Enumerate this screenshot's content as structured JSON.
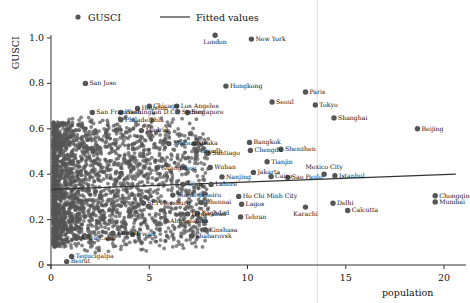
{
  "chart_data": {
    "type": "scatter",
    "title": "",
    "xlabel": "population",
    "ylabel": "GUSCI",
    "xlim": [
      -0.55,
      21.0
    ],
    "ylim": [
      -0.045,
      1.075
    ],
    "xticks": [
      0,
      5,
      10,
      15,
      20
    ],
    "xtick_labels": [
      "0",
      "5",
      "10",
      "15",
      "20"
    ],
    "yticks": [
      0,
      0.2,
      0.4,
      0.6,
      0.8,
      1.0
    ],
    "ytick_labels": [
      "0",
      "0.2",
      "0.4",
      "0.6",
      "0.8",
      "1.0"
    ],
    "grid": false,
    "legend": {
      "position": "top-center",
      "entries": [
        {
          "label": "GUSCI",
          "marker": "circle",
          "color": "#555555"
        },
        {
          "label": "Fitted values",
          "marker": "line",
          "color": "#333333"
        }
      ]
    },
    "marker_color": "#555555",
    "fit_line_color": "#333333",
    "reference_line": {
      "x": 13.55,
      "color": "#d9d9d9",
      "orientation": "vertical"
    },
    "fitted_values": {
      "x": [
        0.05,
        20.6
      ],
      "y": [
        0.333,
        0.4
      ]
    },
    "labeled_points": [
      {
        "name": "London",
        "x": 8.35,
        "y": 1.012,
        "pos": "below-center"
      },
      {
        "name": "New York",
        "x": 10.2,
        "y": 0.995,
        "pos": "right"
      },
      {
        "name": "San Jose",
        "x": 1.75,
        "y": 0.8,
        "pos": "right"
      },
      {
        "name": "Hongkong",
        "x": 8.9,
        "y": 0.788,
        "pos": "right"
      },
      {
        "name": "Paris",
        "x": 12.95,
        "y": 0.762,
        "pos": "right"
      },
      {
        "name": "Seoul",
        "x": 11.25,
        "y": 0.718,
        "pos": "right"
      },
      {
        "name": "Tokyo",
        "x": 13.45,
        "y": 0.705,
        "pos": "right"
      },
      {
        "name": "Shanghai",
        "x": 14.4,
        "y": 0.648,
        "pos": "right"
      },
      {
        "name": "Beijing",
        "x": 18.65,
        "y": 0.6,
        "pos": "right"
      },
      {
        "name": "Chicago",
        "x": 5.0,
        "y": 0.7,
        "pos": "right"
      },
      {
        "name": "Los Angeles",
        "x": 6.4,
        "y": 0.7,
        "pos": "right"
      },
      {
        "name": "Houston",
        "x": 4.4,
        "y": 0.69,
        "pos": "right"
      },
      {
        "name": "Sydney",
        "x": 6.45,
        "y": 0.675,
        "pos": "right"
      },
      {
        "name": "Singapore",
        "x": 6.95,
        "y": 0.672,
        "pos": "right"
      },
      {
        "name": "San Francisco",
        "x": 2.1,
        "y": 0.672,
        "pos": "right"
      },
      {
        "name": "Washington D.C.",
        "x": 3.55,
        "y": 0.672,
        "pos": "right"
      },
      {
        "name": "Philadelphia",
        "x": 3.55,
        "y": 0.64,
        "pos": "right"
      },
      {
        "name": "Madrid",
        "x": 4.6,
        "y": 0.592,
        "pos": "right"
      },
      {
        "name": "Bangkok",
        "x": 10.1,
        "y": 0.54,
        "pos": "right"
      },
      {
        "name": "Melbourne",
        "x": 6.0,
        "y": 0.535,
        "pos": "right"
      },
      {
        "name": "Osaka",
        "x": 7.3,
        "y": 0.535,
        "pos": "right"
      },
      {
        "name": "Shenzhen",
        "x": 11.7,
        "y": 0.51,
        "pos": "right"
      },
      {
        "name": "Chengdu",
        "x": 10.15,
        "y": 0.505,
        "pos": "right"
      },
      {
        "name": "Riyadh",
        "x": 7.4,
        "y": 0.5,
        "pos": "right"
      },
      {
        "name": "Santiago",
        "x": 8.0,
        "y": 0.492,
        "pos": "right"
      },
      {
        "name": "Tianjin",
        "x": 11.0,
        "y": 0.455,
        "pos": "right"
      },
      {
        "name": "Wuhan",
        "x": 8.1,
        "y": 0.43,
        "pos": "right"
      },
      {
        "name": "Guangzhou",
        "x": 5.4,
        "y": 0.428,
        "pos": "right"
      },
      {
        "name": "Jakarta",
        "x": 10.3,
        "y": 0.408,
        "pos": "right"
      },
      {
        "name": "Mexico City",
        "x": 13.9,
        "y": 0.4,
        "pos": "above-center"
      },
      {
        "name": "Istanbul",
        "x": 14.45,
        "y": 0.393,
        "pos": "right"
      },
      {
        "name": "Cairo",
        "x": 11.2,
        "y": 0.39,
        "pos": "right"
      },
      {
        "name": "Nanjing",
        "x": 8.7,
        "y": 0.388,
        "pos": "right"
      },
      {
        "name": "Sao Paulo",
        "x": 12.05,
        "y": 0.385,
        "pos": "right"
      },
      {
        "name": "Xi'an",
        "x": 6.7,
        "y": 0.355,
        "pos": "right"
      },
      {
        "name": "Lahore",
        "x": 8.15,
        "y": 0.355,
        "pos": "right"
      },
      {
        "name": "Rio de Janeiro",
        "x": 6.2,
        "y": 0.308,
        "pos": "right"
      },
      {
        "name": "Ho Chi Minh City",
        "x": 9.55,
        "y": 0.302,
        "pos": "right"
      },
      {
        "name": "Chongqing",
        "x": 19.55,
        "y": 0.305,
        "pos": "right"
      },
      {
        "name": "Mumbai",
        "x": 19.55,
        "y": 0.278,
        "pos": "right"
      },
      {
        "name": "Chennai",
        "x": 7.65,
        "y": 0.275,
        "pos": "right"
      },
      {
        "name": "St.Petersburg",
        "x": 4.7,
        "y": 0.272,
        "pos": "right"
      },
      {
        "name": "Lagos",
        "x": 9.7,
        "y": 0.268,
        "pos": "right"
      },
      {
        "name": "Karachi",
        "x": 12.95,
        "y": 0.255,
        "pos": "below-center"
      },
      {
        "name": "Delhi",
        "x": 14.35,
        "y": 0.272,
        "pos": "right"
      },
      {
        "name": "Calcutta",
        "x": 15.1,
        "y": 0.24,
        "pos": "right"
      },
      {
        "name": "Baghdad",
        "x": 7.45,
        "y": 0.228,
        "pos": "right"
      },
      {
        "name": "Hyderabad",
        "x": 6.95,
        "y": 0.225,
        "pos": "right"
      },
      {
        "name": "Tehran",
        "x": 9.65,
        "y": 0.212,
        "pos": "right"
      },
      {
        "name": "Ahmedabad",
        "x": 5.85,
        "y": 0.195,
        "pos": "right"
      },
      {
        "name": "Kinshasa",
        "x": 7.85,
        "y": 0.155,
        "pos": "right"
      },
      {
        "name": "khabarovsk",
        "x": 7.15,
        "y": 0.128,
        "pos": "right"
      },
      {
        "name": "Kuwait",
        "x": 3.15,
        "y": 0.14,
        "pos": "right"
      },
      {
        "name": "Irwad",
        "x": 4.15,
        "y": 0.135,
        "pos": "right"
      },
      {
        "name": "Astra Cann",
        "x": 1.3,
        "y": 0.118,
        "pos": "right"
      },
      {
        "name": "Tegucigalpa",
        "x": 1.05,
        "y": 0.038,
        "pos": "right"
      },
      {
        "name": "Beirut",
        "x": 0.8,
        "y": 0.015,
        "pos": "right"
      }
    ]
  }
}
